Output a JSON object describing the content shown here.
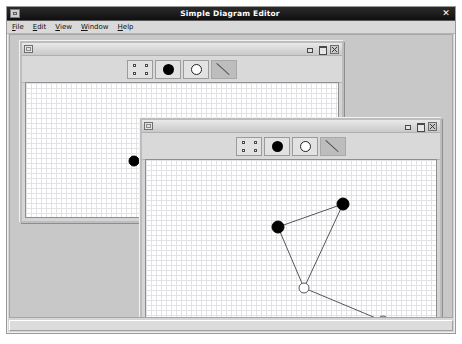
{
  "app": {
    "title": "Simple Diagram Editor",
    "sysicon": "window-restore-icon",
    "close_label": "✕",
    "statusbar_text": ""
  },
  "menubar": {
    "items": [
      {
        "mnemonic": "F",
        "rest": "ile",
        "name": "menu-file"
      },
      {
        "mnemonic": "E",
        "rest": "dit",
        "name": "menu-edit"
      },
      {
        "mnemonic": "V",
        "rest": "iew",
        "name": "menu-view"
      },
      {
        "mnemonic": "W",
        "rest": "indow",
        "name": "menu-window"
      },
      {
        "mnemonic": "H",
        "rest": "elp",
        "name": "menu-help"
      }
    ]
  },
  "toolbar": {
    "tools": [
      {
        "id": "select",
        "icon": "select-handles-icon",
        "label": "Select",
        "enabled": true
      },
      {
        "id": "filled-node",
        "icon": "filled-circle-icon",
        "label": "Filled Node",
        "enabled": true
      },
      {
        "id": "open-node",
        "icon": "open-circle-icon",
        "label": "Open Node",
        "enabled": true
      },
      {
        "id": "line",
        "icon": "line-icon",
        "label": "Line",
        "enabled": false
      }
    ]
  },
  "windows": [
    {
      "id": "win1",
      "title": "",
      "x": 10,
      "y": 6,
      "w": 324,
      "h": 182,
      "buttons": {
        "minimize": "–",
        "maximize": "□",
        "close": "✕"
      },
      "chart_data": {
        "type": "scatter",
        "title": "",
        "nodes": [
          {
            "id": "n1",
            "x": 108,
            "y": 78,
            "r": 5,
            "fill": "#000000",
            "stroke": "#000000"
          }
        ],
        "edges": [
          {
            "from": "n1",
            "to_x": 190,
            "to_y": 98
          }
        ]
      }
    },
    {
      "id": "win2",
      "title": "",
      "x": 130,
      "y": 83,
      "w": 302,
      "h": 214,
      "buttons": {
        "minimize": "–",
        "maximize": "□",
        "close": "✕"
      },
      "chart_data": {
        "type": "scatter",
        "title": "",
        "nodes": [
          {
            "id": "a",
            "x": 132,
            "y": 67,
            "r": 6,
            "fill": "#000000",
            "stroke": "#000000"
          },
          {
            "id": "b",
            "x": 197,
            "y": 44,
            "r": 6,
            "fill": "#000000",
            "stroke": "#000000"
          },
          {
            "id": "c",
            "x": 158,
            "y": 128,
            "r": 5,
            "fill": "#ffffff",
            "stroke": "#555555"
          },
          {
            "id": "d",
            "x": 237,
            "y": 161,
            "r": 5,
            "fill": "#ffffff",
            "stroke": "#555555"
          }
        ],
        "edges": [
          {
            "from": "a",
            "to": "b"
          },
          {
            "from": "a",
            "to": "c"
          },
          {
            "from": "b",
            "to": "c"
          },
          {
            "from": "c",
            "to": "d"
          }
        ]
      }
    }
  ],
  "colors": {
    "titlebar": "#101010",
    "desktop": "#c8c8c8",
    "chrome": "#d6d6d6",
    "node_filled": "#000000",
    "node_open": "#ffffff",
    "edge": "#555555",
    "grid_minor": "#e2e2e6",
    "grid_major": "#cfcfd6"
  }
}
